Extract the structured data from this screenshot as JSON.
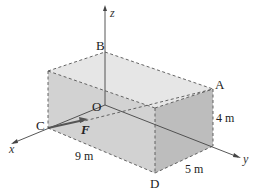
{
  "diagram": {
    "type": "3d-box-force",
    "colors": {
      "background": "#ffffff",
      "top_face": "#e6e6e6",
      "front_face": "#d2d2d2",
      "side_face": "#bdbdbd",
      "edges": "#444444",
      "axes": "#444444",
      "force": "#555555"
    },
    "axes": {
      "x": "x",
      "y": "y",
      "z": "z"
    },
    "points": {
      "origin": "O",
      "A": "A",
      "B": "B",
      "C": "C",
      "D": "D"
    },
    "force_label": "F",
    "dimensions": {
      "length": "9 m",
      "width": "5 m",
      "height": "4 m"
    }
  }
}
